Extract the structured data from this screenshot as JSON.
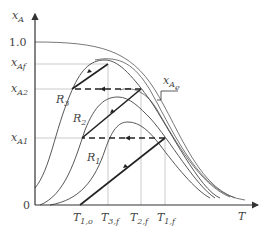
{
  "diagram": {
    "type": "conversion-temperature diagram (multistage adiabatic reactor with interstage cooling)",
    "y_axis": {
      "label": "x",
      "label_sub": "A",
      "ticks": [
        {
          "label": "1.0",
          "sub": ""
        },
        {
          "label": "x",
          "sub": "Af"
        },
        {
          "label": "x",
          "sub": "A2"
        },
        {
          "label": "x",
          "sub": "A1"
        },
        {
          "label": "0",
          "sub": ""
        }
      ]
    },
    "x_axis": {
      "label": "T",
      "ticks": [
        {
          "label": "T",
          "sub": "1,o"
        },
        {
          "label": "T",
          "sub": "3,f"
        },
        {
          "label": "T",
          "sub": "2,f"
        },
        {
          "label": "T",
          "sub": "1,f"
        }
      ]
    },
    "curve_labels": [
      {
        "label": "R",
        "sub": "3"
      },
      {
        "label": "R",
        "sub": "2"
      },
      {
        "label": "R",
        "sub": "1"
      }
    ],
    "equilibrium_label": {
      "label": "x",
      "sub": "A",
      "subsub": "e"
    },
    "colors": {
      "axis": "#333333",
      "curve": "#555555",
      "guide": "#999999",
      "operating": "#222222"
    }
  }
}
